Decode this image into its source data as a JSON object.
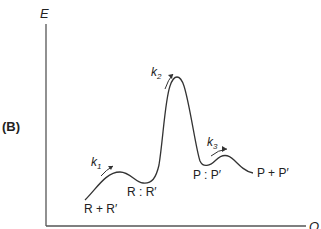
{
  "panel_label": "(B)",
  "axes": {
    "y_label": "E",
    "x_label": "Q"
  },
  "states": {
    "reactants": "R + R′",
    "intermediate_1": "R : R′",
    "intermediate_2": "P : P′",
    "products": "P + P′"
  },
  "rate_constants": {
    "k1": {
      "base": "k",
      "sub": "1"
    },
    "k2": {
      "base": "k",
      "sub": "2"
    },
    "k3": {
      "base": "k",
      "sub": "3"
    }
  },
  "colors": {
    "line": "#333333",
    "text": "#222222"
  }
}
